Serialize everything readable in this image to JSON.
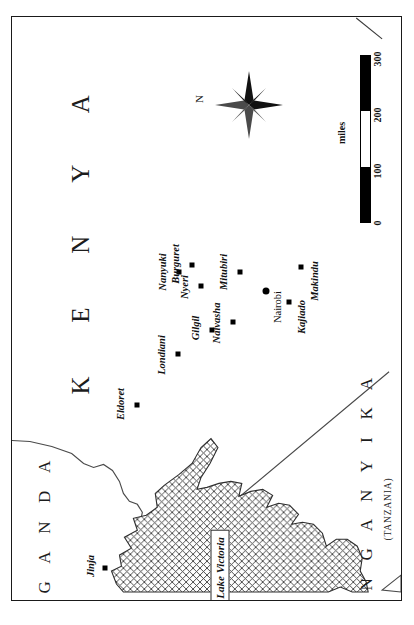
{
  "map": {
    "title": "Kenya and Lake Victoria region",
    "orientation_note": "map printed sideways; north points to the right of the page",
    "frame": {
      "border_color": "#1a1a1a",
      "background": "#ffffff"
    }
  },
  "countries": [
    {
      "id": "kenya",
      "label": "K E N Y A"
    },
    {
      "id": "uganda",
      "label": "U G A N D A"
    },
    {
      "id": "tanganyika",
      "label": "T A N G A N Y I K A",
      "subtitle": "(TANZANIA)"
    }
  ],
  "water": [
    {
      "id": "lake-victoria",
      "label": "Lake Victoria",
      "fill": "cross-hatch"
    }
  ],
  "cities": [
    {
      "name": "Nanyuki",
      "marker": "square",
      "x": 178,
      "y": 271
    },
    {
      "name": "Burguret",
      "marker": "square",
      "x": 191,
      "y": 264
    },
    {
      "name": "Nyeri",
      "marker": "square",
      "x": 200,
      "y": 285
    },
    {
      "name": "Mitubiri",
      "marker": "square",
      "x": 239,
      "y": 271
    },
    {
      "name": "Makindu",
      "marker": "square",
      "x": 300,
      "y": 266
    },
    {
      "name": "Nairobi",
      "marker": "circle",
      "x": 265,
      "y": 290
    },
    {
      "name": "Kajiado",
      "marker": "square",
      "x": 288,
      "y": 301
    },
    {
      "name": "Naivasha",
      "marker": "square",
      "x": 232,
      "y": 321
    },
    {
      "name": "Gilgil",
      "marker": "square",
      "x": 211,
      "y": 329
    },
    {
      "name": "Londiani",
      "marker": "square",
      "x": 177,
      "y": 353
    },
    {
      "name": "Eldoret",
      "marker": "square",
      "x": 136,
      "y": 404
    },
    {
      "name": "Jinja",
      "marker": "square",
      "x": 104,
      "y": 567
    }
  ],
  "scale": {
    "unit": "miles",
    "ticks": [
      "0",
      "100",
      "200",
      "300"
    ],
    "segments": [
      "fill",
      "empty",
      "fill"
    ],
    "max": 300
  },
  "compass": {
    "north_label": "N",
    "points": 8
  }
}
